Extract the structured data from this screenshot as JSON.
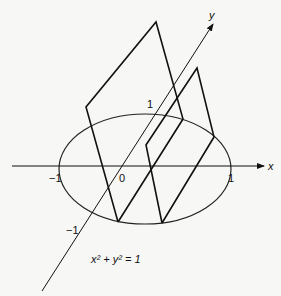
{
  "diagram": {
    "equation": "x² + y² = 1",
    "axes": {
      "x_label": "x",
      "y_label": "y"
    },
    "ticks": {
      "x_neg": "−1",
      "x_pos": "1",
      "origin": "0",
      "y_pos": "1",
      "y_neg": "−1"
    },
    "colors": {
      "stroke": "#111111",
      "background": "#f7f7f5"
    }
  }
}
